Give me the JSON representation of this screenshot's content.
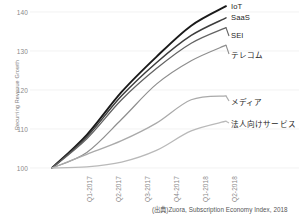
{
  "chart_data": {
    "type": "line",
    "title": "",
    "xlabel": "",
    "ylabel": "Recurring Revenue Growth",
    "categories": [
      "Q1-2017",
      "Q2-2017",
      "Q3-2017",
      "Q4-2017",
      "Q1-2018",
      "Q2-2018"
    ],
    "yticks": [
      100,
      110,
      120,
      130,
      140
    ],
    "ylim": [
      98,
      142
    ],
    "grid": true,
    "legend_position": "right-inline-labels",
    "source_note": "(出典)Zuora, Subscription Economy Index, 2018",
    "series": [
      {
        "name": "IoT",
        "color": "#1a1a1a",
        "width": 1.9,
        "values": [
          100,
          108.5,
          119.5,
          128.5,
          136.5,
          141.5
        ]
      },
      {
        "name": "SaaS",
        "color": "#3d3d3d",
        "width": 1.5,
        "values": [
          100,
          108.0,
          118.5,
          127.0,
          134.0,
          138.5
        ]
      },
      {
        "name": "SEI",
        "color": "#636363",
        "width": 1.3,
        "values": [
          100,
          107.5,
          117.5,
          125.5,
          132.0,
          136.0
        ]
      },
      {
        "name": "テレコム",
        "color": "#8e8e8e",
        "width": 1.2,
        "values": [
          100,
          104.0,
          112.5,
          121.5,
          127.5,
          131.5
        ]
      },
      {
        "name": "メディア",
        "color": "#aaaaaa",
        "width": 1.3,
        "values": [
          100,
          103.5,
          107.0,
          111.5,
          117.5,
          118.5
        ]
      },
      {
        "name": "法人向けサービス",
        "color": "#b9b9b9",
        "width": 1.3,
        "values": [
          100,
          100.3,
          101.5,
          104.5,
          109.5,
          112.0
        ]
      }
    ]
  },
  "axis": {
    "ytick_labels": [
      "140",
      "130",
      "120",
      "110",
      "100"
    ],
    "xtick_labels": [
      "Q1-2017",
      "Q2-2017",
      "Q3-2017",
      "Q4-2017",
      "Q1-2018",
      "Q2-2018"
    ],
    "ylabel_text": "Recurring Revenue Growth"
  },
  "labels": {
    "iot": "IoT",
    "saas": "SaaS",
    "sei": "SEI",
    "telecom": "テレコム",
    "media": "メディア",
    "b2b": "法人向けサービス"
  },
  "source": "(出典)Zuora, Subscription Economy Index, 2018",
  "colors": {
    "background": "#ffffff",
    "grid": "#ededed",
    "tick_text": "#8a8a8a",
    "label_text": "#1e1e1e",
    "source_text": "#555555"
  }
}
